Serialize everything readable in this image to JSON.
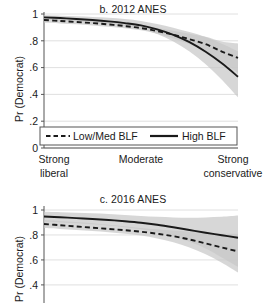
{
  "chart_data": [
    {
      "type": "line",
      "title": "b. 2012 ANES",
      "xlabel": "",
      "ylabel": "Pr (Democrat)",
      "ylim": [
        0,
        1
      ],
      "yticks": [
        "0",
        ".2",
        ".4",
        ".6",
        ".8",
        "1"
      ],
      "ytick_values": [
        0,
        0.2,
        0.4,
        0.6,
        0.8,
        1
      ],
      "xlim": [
        1,
        7
      ],
      "xticks": [
        "Strong liberal",
        "Moderate",
        "Strong conservative"
      ],
      "xtick_lines": [
        [
          "Strong",
          "liberal"
        ],
        [
          "Moderate",
          ""
        ],
        [
          "Strong",
          "conservative"
        ]
      ],
      "xtick_values": [
        1,
        4,
        7
      ],
      "grid": true,
      "legend_position": "bottom-inside",
      "x": [
        1,
        1.5,
        2,
        2.5,
        3,
        3.5,
        4,
        4.5,
        5,
        5.5,
        6,
        6.5,
        7
      ],
      "series": [
        {
          "name": "Low/Med BLF",
          "style": "dashed",
          "values": [
            0.955,
            0.948,
            0.94,
            0.932,
            0.922,
            0.91,
            0.895,
            0.873,
            0.845,
            0.812,
            0.775,
            0.72,
            0.672
          ],
          "band_lower": [
            0.935,
            0.93,
            0.923,
            0.915,
            0.905,
            0.893,
            0.878,
            0.852,
            0.818,
            0.775,
            0.72,
            0.645,
            0.56
          ],
          "band_upper": [
            0.972,
            0.966,
            0.958,
            0.95,
            0.94,
            0.928,
            0.913,
            0.895,
            0.875,
            0.852,
            0.83,
            0.795,
            0.78
          ]
        },
        {
          "name": "High BLF",
          "style": "solid",
          "values": [
            0.975,
            0.97,
            0.963,
            0.955,
            0.945,
            0.932,
            0.915,
            0.885,
            0.845,
            0.79,
            0.718,
            0.632,
            0.532
          ],
          "band_lower": [
            0.958,
            0.952,
            0.944,
            0.935,
            0.924,
            0.91,
            0.888,
            0.85,
            0.795,
            0.72,
            0.625,
            0.51,
            0.378
          ],
          "band_upper": [
            0.99,
            0.987,
            0.983,
            0.978,
            0.972,
            0.962,
            0.948,
            0.925,
            0.898,
            0.865,
            0.828,
            0.778,
            0.722
          ]
        }
      ]
    },
    {
      "type": "line",
      "title": "c. 2016 ANES",
      "xlabel": "",
      "ylabel": "Pr (Democrat)",
      "ylim": [
        0.3,
        1
      ],
      "yticks": [
        "1",
        ".8",
        ".6",
        ".4"
      ],
      "ytick_values": [
        1,
        0.8,
        0.6,
        0.4
      ],
      "xlim": [
        1,
        7
      ],
      "grid": true,
      "x": [
        1,
        1.5,
        2,
        2.5,
        3,
        3.5,
        4,
        4.5,
        5,
        5.5,
        6,
        6.5,
        7
      ],
      "series": [
        {
          "name": "Low/Med BLF",
          "style": "dashed",
          "values": [
            0.888,
            0.878,
            0.868,
            0.858,
            0.848,
            0.838,
            0.826,
            0.81,
            0.79,
            0.764,
            0.732,
            0.7,
            0.668
          ],
          "band_lower": [
            0.855,
            0.848,
            0.84,
            0.832,
            0.822,
            0.81,
            0.795,
            0.772,
            0.742,
            0.7,
            0.645,
            0.578,
            0.5
          ],
          "band_upper": [
            0.92,
            0.912,
            0.903,
            0.893,
            0.882,
            0.87,
            0.856,
            0.845,
            0.835,
            0.825,
            0.815,
            0.81,
            0.81
          ]
        },
        {
          "name": "High BLF",
          "style": "solid",
          "values": [
            0.948,
            0.942,
            0.935,
            0.928,
            0.92,
            0.91,
            0.898,
            0.882,
            0.862,
            0.84,
            0.818,
            0.798,
            0.778
          ],
          "band_lower": [
            0.905,
            0.9,
            0.893,
            0.885,
            0.875,
            0.862,
            0.845,
            0.82,
            0.788,
            0.745,
            0.692,
            0.62,
            0.545
          ],
          "band_upper": [
            0.985,
            0.982,
            0.978,
            0.974,
            0.968,
            0.96,
            0.952,
            0.945,
            0.94,
            0.938,
            0.94,
            0.945,
            0.955
          ]
        }
      ]
    }
  ],
  "panel_b": {
    "title": "b. 2012 ANES",
    "ylabel": "Pr (Democrat)",
    "yticks": [
      "1",
      ".8",
      ".6",
      ".4",
      ".2",
      "0"
    ],
    "xticks": [
      {
        "line1": "Strong",
        "line2": "liberal"
      },
      {
        "line1": "Moderate",
        "line2": ""
      },
      {
        "line1": "Strong",
        "line2": "conservative"
      }
    ],
    "legend": {
      "dashed_label": "Low/Med BLF",
      "solid_label": "High BLF"
    }
  },
  "panel_c": {
    "title": "c. 2016 ANES",
    "ylabel": "Pr (Democrat)",
    "yticks": [
      "1",
      ".8",
      ".6",
      ".4"
    ]
  },
  "colors": {
    "line": "#1a1a1a",
    "band": "#c8c8c8",
    "grid": "#d8d8d8",
    "axis": "#555555",
    "background": "#ffffff"
  }
}
